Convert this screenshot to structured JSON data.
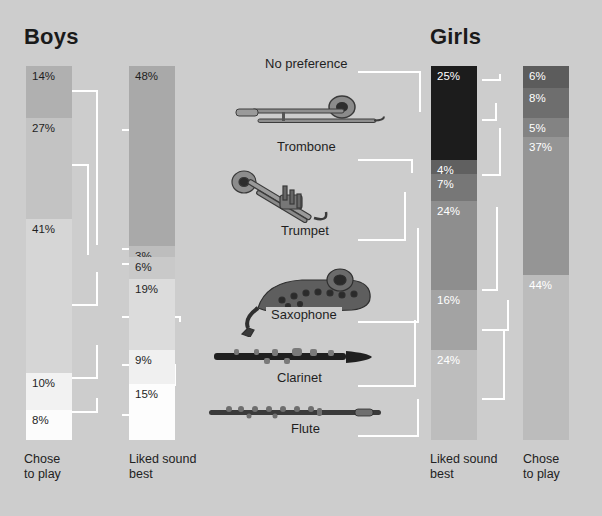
{
  "headings": {
    "left": "Boys",
    "right": "Girls"
  },
  "axis_labels": {
    "boys_chose": "Chose\nto play",
    "boys_liked": "Liked sound\nbest",
    "girls_liked": "Liked sound\nbest",
    "girls_chose": "Chose\nto play"
  },
  "instruments": [
    {
      "name": "No preference",
      "icon": "none-icon"
    },
    {
      "name": "Trombone",
      "icon": "trombone-icon"
    },
    {
      "name": "Trumpet",
      "icon": "trumpet-icon"
    },
    {
      "name": "Saxophone",
      "icon": "saxophone-icon"
    },
    {
      "name": "Clarinet",
      "icon": "clarinet-icon"
    },
    {
      "name": "Flute",
      "icon": "flute-icon"
    }
  ],
  "colors": {
    "background": "#cdcdcd",
    "connector": "#ffffff",
    "boys_chose": [
      "#b3b3b3",
      "#c4c4c4",
      "#d4d4d4",
      "# efefef",
      "#fbfbfb"
    ],
    "girls_top": "#1c1c1c"
  },
  "chart_data": {
    "type": "bar",
    "categories": [
      "No preference",
      "Trombone",
      "Trumpet",
      "Saxophone",
      "Clarinet",
      "Flute"
    ],
    "units": "percent",
    "ylim": [
      0,
      100
    ],
    "grid": false,
    "legend": "none",
    "series": [
      {
        "name": "Boys - Chose to play",
        "group": "Boys",
        "axis_label": "Chose to play",
        "segments": [
          {
            "category": "No preference",
            "value": 14,
            "label": "14%",
            "color": "#b0b0b0",
            "text": "dark"
          },
          {
            "category": "Trombone + Trumpet",
            "value": 27,
            "label": "27%",
            "color": "#c3c3c3",
            "text": "dark"
          },
          {
            "category": "Saxophone",
            "value": 41,
            "label": "41%",
            "color": "#d6d6d6",
            "text": "dark"
          },
          {
            "category": "Clarinet",
            "value": 10,
            "label": "10%",
            "color": "#f2f2f2",
            "text": "dark"
          },
          {
            "category": "Flute",
            "value": 8,
            "label": "8%",
            "color": "#fcfcfc",
            "text": "dark"
          }
        ]
      },
      {
        "name": "Boys - Liked sound best",
        "group": "Boys",
        "axis_label": "Liked sound best",
        "segments": [
          {
            "category": "No preference",
            "value": 48,
            "label": "48%",
            "color": "#a9a9a9",
            "text": "dark"
          },
          {
            "category": "Trombone",
            "value": 3,
            "label": "3%",
            "color": "#bdbdbd",
            "text": "dark"
          },
          {
            "category": "Trumpet",
            "value": 6,
            "label": "6%",
            "color": "#c9c9c9",
            "text": "dark"
          },
          {
            "category": "Saxophone",
            "value": 19,
            "label": "19%",
            "color": "#dcdcdc",
            "text": "dark"
          },
          {
            "category": "Clarinet",
            "value": 9,
            "label": "9%",
            "color": "#f0f0f0",
            "text": "dark"
          },
          {
            "category": "Flute",
            "value": 15,
            "label": "15%",
            "color": "#fdfdfd",
            "text": "dark"
          }
        ]
      },
      {
        "name": "Girls - Liked sound best",
        "group": "Girls",
        "axis_label": "Liked sound best",
        "segments": [
          {
            "category": "No preference",
            "value": 25,
            "label": "25%",
            "color": "#1c1c1c",
            "text": "light"
          },
          {
            "category": "Trombone",
            "value": 4,
            "label": "4%",
            "color": "#606060",
            "text": "light"
          },
          {
            "category": "Trumpet",
            "value": 7,
            "label": "7%",
            "color": "#777777",
            "text": "light"
          },
          {
            "category": "Saxophone",
            "value": 24,
            "label": "24%",
            "color": "#8e8e8e",
            "text": "light"
          },
          {
            "category": "Clarinet",
            "value": 16,
            "label": "16%",
            "color": "#a3a3a3",
            "text": "light"
          },
          {
            "category": "Flute",
            "value": 24,
            "label": "24%",
            "color": "#bdbdbd",
            "text": "light"
          }
        ]
      },
      {
        "name": "Girls - Chose to play",
        "group": "Girls",
        "axis_label": "Chose to play",
        "segments": [
          {
            "category": "No preference",
            "value": 6,
            "label": "6%",
            "color": "#5c5c5c",
            "text": "light"
          },
          {
            "category": "Trombone",
            "value": 8,
            "label": "8%",
            "color": "#6e6e6e",
            "text": "light"
          },
          {
            "category": "Trumpet",
            "value": 5,
            "label": "5%",
            "color": "#838383",
            "text": "light"
          },
          {
            "category": "Saxophone",
            "value": 37,
            "label": "37%",
            "color": "#959595",
            "text": "light"
          },
          {
            "category": "Clarinet + Flute",
            "value": 44,
            "label": "44%",
            "color": "#bcbcbc",
            "text": "light"
          }
        ]
      }
    ]
  }
}
